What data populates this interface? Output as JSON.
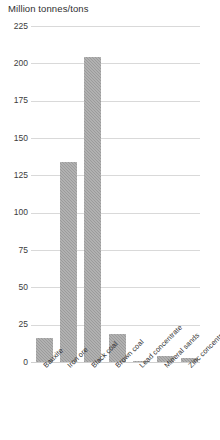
{
  "chart_data": {
    "type": "bar",
    "title": "Million tonnes/tons",
    "xlabel": "",
    "ylabel": "Million tonnes/tons",
    "categories": [
      "Bauxite",
      "Iron ore",
      "Black coal",
      "Brown coal",
      "Lead concentrate",
      "Mineral sands",
      "Zinc concentrate"
    ],
    "values": [
      16,
      134,
      204,
      19,
      1,
      4,
      3
    ],
    "ylim": [
      0,
      225
    ],
    "yticks": [
      0,
      25,
      50,
      75,
      100,
      125,
      150,
      175,
      200,
      225
    ],
    "ytick_labels": [
      "0",
      "25",
      "50",
      "75",
      "100",
      "125",
      "150",
      "175",
      "200",
      "225"
    ],
    "grid": true,
    "legend": false,
    "bar_color": "#9b9b9b",
    "gridline_color": "#d9d9d9",
    "background_color": "#ffffff"
  }
}
